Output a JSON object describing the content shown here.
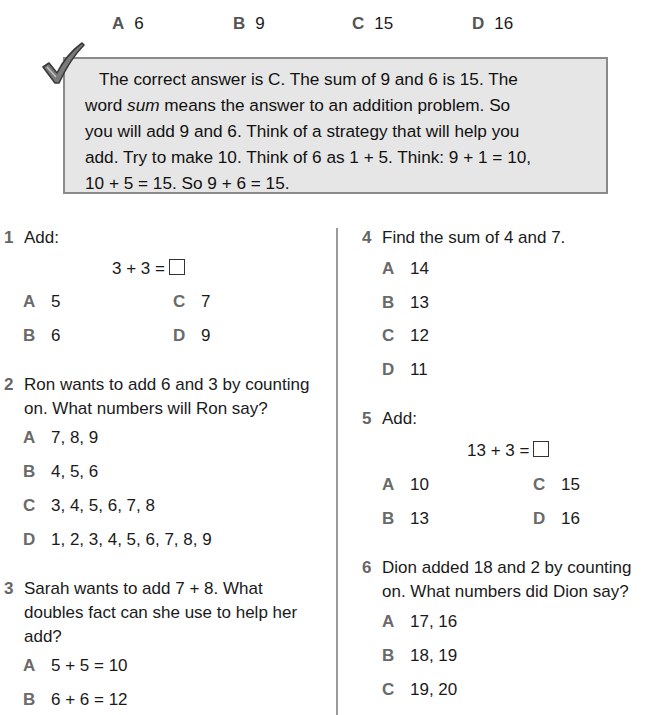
{
  "example": {
    "choices": [
      {
        "letter": "A",
        "value": "6"
      },
      {
        "letter": "B",
        "value": "9"
      },
      {
        "letter": "C",
        "value": "15"
      },
      {
        "letter": "D",
        "value": "16"
      }
    ],
    "explanation": {
      "line1": "The correct answer is C. The sum of 9 and 6 is 15. The",
      "line2_pre": "word ",
      "line2_em": "sum",
      "line2_post": " means the answer to an addition problem. So",
      "line3": "you will add 9 and 6. Think of a strategy that will help you",
      "line4": "add. Try to make 10. Think of 6 as 1 + 5. Think: 9 + 1 = 10,",
      "line5": "10 + 5 = 15. So 9 + 6 = 15."
    },
    "icon": "checkmark-icon"
  },
  "questions": [
    {
      "number": "1",
      "text": "Add:",
      "equation": "3 + 3 =",
      "options": [
        {
          "letter": "A",
          "value": "5"
        },
        {
          "letter": "B",
          "value": "6"
        },
        {
          "letter": "C",
          "value": "7"
        },
        {
          "letter": "D",
          "value": "9"
        }
      ]
    },
    {
      "number": "2",
      "text_line1": "Ron wants to add 6 and 3 by counting",
      "text_line2": "on. What numbers will Ron say?",
      "options": [
        {
          "letter": "A",
          "value": "7, 8, 9"
        },
        {
          "letter": "B",
          "value": "4, 5, 6"
        },
        {
          "letter": "C",
          "value": "3, 4, 5, 6, 7, 8"
        },
        {
          "letter": "D",
          "value": "1, 2, 3, 4, 5, 6, 7, 8, 9"
        }
      ]
    },
    {
      "number": "3",
      "text_line1": "Sarah wants to add 7 + 8. What",
      "text_line2": "doubles fact can she use to help her",
      "text_line3": "add?",
      "options": [
        {
          "letter": "A",
          "value": "5 + 5 = 10"
        },
        {
          "letter": "B",
          "value": "6 + 6 = 12"
        }
      ]
    },
    {
      "number": "4",
      "text": "Find the sum of 4 and 7.",
      "options": [
        {
          "letter": "A",
          "value": "14"
        },
        {
          "letter": "B",
          "value": "13"
        },
        {
          "letter": "C",
          "value": "12"
        },
        {
          "letter": "D",
          "value": "11"
        }
      ]
    },
    {
      "number": "5",
      "text": "Add:",
      "equation": "13 + 3 =",
      "options": [
        {
          "letter": "A",
          "value": "10"
        },
        {
          "letter": "B",
          "value": "13"
        },
        {
          "letter": "C",
          "value": "15"
        },
        {
          "letter": "D",
          "value": "16"
        }
      ]
    },
    {
      "number": "6",
      "text_line1": "Dion added 18 and 2 by counting",
      "text_line2": "on. What numbers did Dion say?",
      "options": [
        {
          "letter": "A",
          "value": "17, 16"
        },
        {
          "letter": "B",
          "value": "18, 19"
        },
        {
          "letter": "C",
          "value": "19, 20"
        }
      ]
    }
  ],
  "colors": {
    "box_fill": "#e6e6e6",
    "box_border": "#8a8a8a",
    "letter_gray": "#6a6a6a"
  }
}
